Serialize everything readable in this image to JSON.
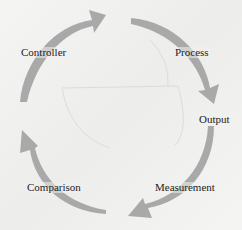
{
  "diagram": {
    "type": "cycle",
    "direction": "clockwise",
    "colors": {
      "background": "#efefee",
      "arrow_fill": "#a9a9a9",
      "text": "#222222",
      "faint_lines": "#d8d8d6"
    },
    "labels": {
      "controller": "Controller",
      "process": "Process",
      "output": "Output",
      "measurement": "Measurement",
      "comparison": "Comparison"
    },
    "arrows": [
      {
        "id": "arrow-controller-to-process",
        "from": "Controller",
        "to": "Process",
        "icon": "curved-arrow-icon"
      },
      {
        "id": "arrow-process-to-output",
        "from": "Process",
        "to": "Output",
        "icon": "curved-arrow-icon"
      },
      {
        "id": "arrow-output-to-comparison",
        "from": "Output",
        "to": "Comparison",
        "via": "Measurement",
        "icon": "curved-arrow-icon"
      },
      {
        "id": "arrow-comparison-to-controller",
        "from": "Comparison",
        "to": "Controller",
        "icon": "curved-arrow-icon"
      }
    ]
  }
}
